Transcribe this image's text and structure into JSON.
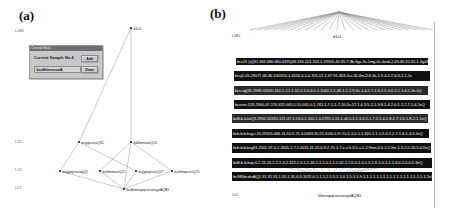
{
  "figure": {
    "panels": [
      {
        "id": "a",
        "label": "(a)"
      },
      {
        "id": "b",
        "label": "(b)"
      }
    ]
  },
  "panel_a": {
    "level_labels": [
      {
        "text": "L0B1",
        "x": 15,
        "y": 29
      },
      {
        "text": "L32",
        "x": 15,
        "y": 140
      },
      {
        "text": "L10",
        "x": 15,
        "y": 168
      },
      {
        "text": "L01",
        "x": 15,
        "y": 186
      }
    ],
    "nodes": [
      {
        "id": "top",
        "label": "d1v1",
        "x": 131,
        "y": 27
      },
      {
        "id": "n1",
        "label": "bcgipsuvxQ31",
        "x": 79,
        "y": 142
      },
      {
        "id": "n2",
        "label": "bdklmnovxQ24",
        "x": 131,
        "y": 142
      },
      {
        "id": "n3",
        "label": "bcgipqrsuvxgQ2",
        "x": 60,
        "y": 171
      },
      {
        "id": "n4",
        "label": "bcklmnovxQ21",
        "x": 100,
        "y": 171
      },
      {
        "id": "n5",
        "label": "bcjgipqsuvxQ27",
        "x": 136,
        "y": 171
      },
      {
        "id": "n6",
        "label": "bcklmqsuvxQ21",
        "x": 172,
        "y": 171
      },
      {
        "id": "bot",
        "label": "bcdkmnopqrstuvwxyzAQB1",
        "x": 124,
        "y": 189
      }
    ],
    "dialog": {
      "title": "Concept Mask",
      "caption": "Current Sample No.4",
      "input_value": "bcdklmnovxA",
      "input_placeholder": "",
      "buttons": [
        {
          "id": "add",
          "label": "Add"
        },
        {
          "id": "draw",
          "label": "Draw"
        }
      ]
    }
  },
  "panel_b": {
    "level_labels": [
      {
        "text": "L0B1",
        "x": 232,
        "y": 36
      },
      {
        "text": "L01",
        "x": 232,
        "y": 194
      }
    ],
    "top_node": "d1v1",
    "bottom_node": "klmnopqrstuvwxyzAQB1",
    "rows": [
      {
        "y": 58,
        "h": 7,
        "text": "bcx21 (v)(31-361-680-660-4195)46-316-201-324-1-19901-40-35-7-8b-3gx-3v-1mg-0x-4xxb-2-43-46-10-32-1-2gx31"
      },
      {
        "y": 71,
        "h": 10,
        "text": "bcxj1-05-29077-46-46-1005/51-1-6116-6-1-0-701-07-1-67-91-463-2vv-31-4m-2-6-3x-1-9-4-1-7-6-3-2-1-1x"
      },
      {
        "y": 86,
        "h": 9,
        "text": "bcx-xg(30-2989-01905-110-1-C1-1-51-0-1-6-6-0-1-1040-1-1-46-1-1-2-9-3x-1-4-2-7-1-6-1-5-3-0-2-1-1-6-1-3x-0Q"
      },
      {
        "y": 100,
        "h": 9,
        "text": "bcxvxv-123-2900-07-170-321-005-1-51-001-0-1-741-1-7-1-1-7-10-1v-27-1-4-3-5-2-1-9-8-1-4-2-0-1-1-2-7-1-4-1xQ"
      },
      {
        "y": 114,
        "h": 9,
        "text": "bcB-b-k-kxQ3-2902-02410-121-07-1-53-0-1-100-1-0-5755-1-11-1-v6-0-1-1-3-4-5-1-7-2-1-4-1-8-2-7-1-6-1-8-2-1-1xQ"
      },
      {
        "y": 129,
        "h": 9,
        "text": "bcb-b-b-kxg-t-13-29205-466-11-10-5-71-4-0063-30-51-3-06-0-5^-7v-1-1-0-1-1-315-1-1-1-9-4-2-2-7-1-6-1-4-5-3xQ"
      },
      {
        "y": 143,
        "h": 10,
        "text": "bcb-b-b-kxg31-2501-37-0-1-2001-1-7-1-0011-11-15-0-9-2-70-1-7-x-x-h-3-1-v-1-2-9mn-4-0-1-5-9m-1-3-2-0-10-5-4-9vQ"
      },
      {
        "y": 158,
        "h": 10,
        "text": "bcB-b-b-kxq-0-2-21-21-2-2-2-4-2-122-2-3-1-1-16-1-1-1-0-1-1-1-02-2-7-0-0-1-0-1-5-1-9-1-0-1-1-1-4-0-2-0-0-5-3xQ"
      },
      {
        "y": 172,
        "h": 9,
        "text": "bc980bcxkvAQ1-31-31-31-1-31-1-31-0-3-1021-0-1-1-1-2-1-5-1-1-0-1-5-5-1-9-1-1-1-1-1-1-1-1-1-1-1-1-1-1-1-1-1-1-1-1xQ"
      }
    ],
    "right_rule": {
      "x": 434,
      "y": 22,
      "h": 186
    }
  },
  "colors": {
    "background": "#ffffff",
    "edge": "#888888",
    "node": "#222222",
    "dialog_face": "#c8c8c8",
    "dialog_title": "#6d6d7a",
    "dense_row": "#101010",
    "rule": "#b6b6b6"
  }
}
